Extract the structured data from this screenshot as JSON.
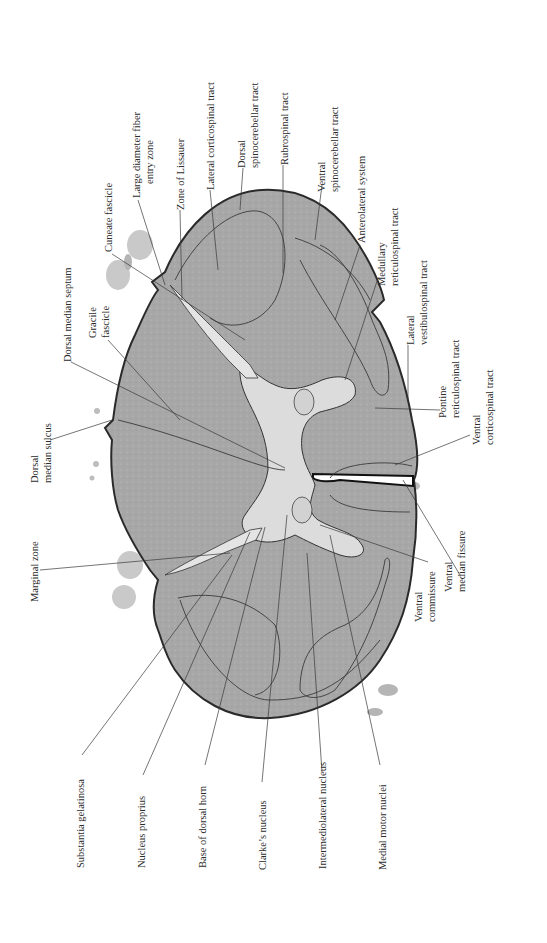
{
  "figure": {
    "colors": {
      "white_matter": "#a9a9a9",
      "gray_matter": "#d8d8d8",
      "outline": "#2a2a2a",
      "leader_line": "#3a3a3a",
      "background": "#ffffff"
    }
  },
  "labels": {
    "top": [
      {
        "id": "cuneate-fascicle",
        "lines": [
          "Cuneate fascicle"
        ]
      },
      {
        "id": "large-diameter-fiber-entry-zone",
        "lines": [
          "Large diameter fiber",
          "entry zone"
        ]
      },
      {
        "id": "zone-of-lissauer",
        "lines": [
          "Zone of Lissauer"
        ]
      },
      {
        "id": "lateral-corticospinal-tract",
        "lines": [
          "Lateral corticospinal tract"
        ]
      },
      {
        "id": "dorsal-spinocerebellar-tract",
        "lines": [
          "Dorsal",
          "spinocerebellar tract"
        ]
      },
      {
        "id": "rubrospinal-tract",
        "lines": [
          "Rubrospinal tract"
        ]
      },
      {
        "id": "ventral-spinocerebellar-tract",
        "lines": [
          "Ventral",
          "spinocerebellar tract"
        ]
      },
      {
        "id": "anterolateral-system",
        "lines": [
          "Anterolateral system"
        ]
      },
      {
        "id": "medullary-reticulospinal-tract",
        "lines": [
          "Medullary",
          "reticulospinal tract"
        ]
      },
      {
        "id": "lateral-vestibulospinal-tract",
        "lines": [
          "Lateral",
          "vestibulospinal tract"
        ]
      },
      {
        "id": "pontine-reticulospinal-tract",
        "lines": [
          "Pontine",
          "reticulospinal tract"
        ]
      },
      {
        "id": "ventral-corticospinal-tract",
        "lines": [
          "Ventral",
          "corticospinal tract"
        ]
      }
    ],
    "left": [
      {
        "id": "dorsal-median-septum",
        "lines": [
          "Dorsal median septum"
        ]
      },
      {
        "id": "gracile-fascicle",
        "lines": [
          "Gracile",
          "fascicle"
        ]
      },
      {
        "id": "dorsal-median-sulcus",
        "lines": [
          "Dorsal",
          "median sulcus"
        ]
      },
      {
        "id": "marginal-zone",
        "lines": [
          "Marginal zone"
        ]
      }
    ],
    "right": [
      {
        "id": "ventral-median-fissure",
        "lines": [
          "Ventral",
          "median fissure"
        ]
      },
      {
        "id": "ventral-commissure",
        "lines": [
          "Ventral",
          "commissure"
        ]
      }
    ],
    "bottom": [
      {
        "id": "substantia-gelatinosa",
        "lines": [
          "Substantia gelatinosa"
        ]
      },
      {
        "id": "nucleus-proprius",
        "lines": [
          "Nucleus proprius"
        ]
      },
      {
        "id": "base-of-dorsal-horn",
        "lines": [
          "Base of dorsal horn"
        ]
      },
      {
        "id": "clarkes-nucleus",
        "lines": [
          "Clarke’s nucleus"
        ]
      },
      {
        "id": "intermediolateral-nucleus",
        "lines": [
          "Intermediolateral nucleus"
        ]
      },
      {
        "id": "medial-motor-nuclei",
        "lines": [
          "Medial motor nuclei"
        ]
      }
    ]
  }
}
